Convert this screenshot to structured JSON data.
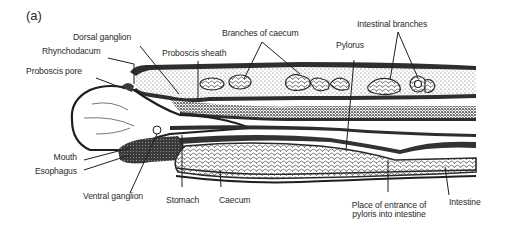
{
  "figure": {
    "panel_label": "(a)",
    "labels": {
      "dorsal_ganglion": "Dorsal ganglion",
      "rhynchodacum": "Rhynchodacum",
      "proboscis_pore": "Proboscis pore",
      "proboscis_sheath": "Proboscis sheath",
      "branches_of_caecum": "Branches of caecum",
      "intestinal_branches": "Intestinal branches",
      "pylorus": "Pylorus",
      "mouth": "Mouth",
      "esophagus": "Esophagus",
      "ventral_ganglion": "Ventral ganglion",
      "stomach": "Stomach",
      "caecum": "Caecum",
      "place_of_entrance_line1": "Place of entrance of",
      "place_of_entrance_line2": "pyloris into intestine",
      "intestine": "Intestine"
    },
    "colors": {
      "ink": "#2a2a2a",
      "background": "#ffffff",
      "stipple": "#6a6a6a"
    }
  }
}
